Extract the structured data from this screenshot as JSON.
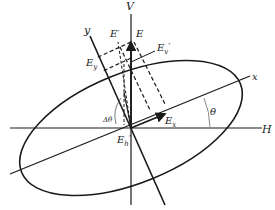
{
  "diagram": {
    "type": "polarization-ellipse",
    "colors": {
      "line": "#1a1a1a",
      "dashed": "#1a1a1a",
      "angle_arc": "#888888"
    },
    "labels": {
      "V": "V",
      "H": "H",
      "x": "x",
      "y": "y",
      "E": "E",
      "E_prime": "E′",
      "E_y": "E",
      "E_y_sub": "y",
      "E_x": "E",
      "E_x_sub": "x",
      "E_v_prime": "E",
      "E_v_prime_sub": "v",
      "E_v_prime_mark": "′",
      "E_h_prime": "E",
      "E_h_prime_sub": "h",
      "E_h_prime_mark": "′",
      "theta": "θ",
      "delta_theta": "Δθ"
    }
  }
}
